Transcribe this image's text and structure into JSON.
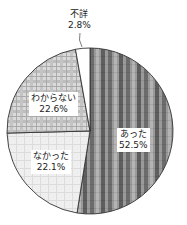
{
  "chart_data": {
    "type": "pie",
    "title": "",
    "start_angle_deg": 0,
    "direction": "clockwise",
    "slices": [
      {
        "label": "あった",
        "value": 52.5,
        "value_text": "52.5%",
        "pattern": "vertical-stripes-dark",
        "color": "#7a7a7a"
      },
      {
        "label": "なかった",
        "value": 22.1,
        "value_text": "22.1%",
        "pattern": "light-check",
        "color": "#ececec"
      },
      {
        "label": "わからない",
        "value": 22.6,
        "value_text": "22.6%",
        "pattern": "plaid-medium",
        "color": "#cfcfcf"
      },
      {
        "label": "不詳",
        "value": 2.8,
        "value_text": "2.8%",
        "pattern": "none",
        "color": "#ffffff"
      }
    ]
  },
  "labels": {
    "atta": {
      "name": "あった",
      "pct": "52.5%"
    },
    "nakatta": {
      "name": "なかった",
      "pct": "22.1%"
    },
    "wakaranai": {
      "name": "わからない",
      "pct": "22.6%"
    },
    "fusho": {
      "name": "不詳",
      "pct": "2.8%"
    }
  }
}
